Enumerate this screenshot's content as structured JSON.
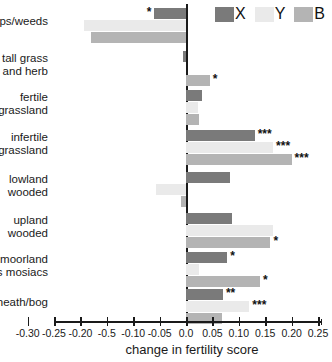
{
  "chart_data": {
    "type": "bar",
    "orientation": "horizontal",
    "title": "",
    "xlabel": "change in fertility score",
    "ylabel": "",
    "xlim": [
      -0.3,
      0.25
    ],
    "grid": false,
    "legend_position": "top-right",
    "zero_reference_line": true,
    "categories": [
      "crops/weeds",
      "tall grass and herb",
      "fertile grassland",
      "infertile grassland",
      "lowland wooded",
      "upland wooded",
      "moorland grass mosiacs",
      "heath/bog"
    ],
    "category_lines": [
      [
        "crops/weeds"
      ],
      [
        "tall grass",
        "and herb"
      ],
      [
        "fertile",
        "grassland"
      ],
      [
        "infertile",
        "grassland"
      ],
      [
        "lowland",
        "wooded"
      ],
      [
        "upland",
        "wooded"
      ],
      [
        "moorland",
        "grass mosiacs"
      ],
      [
        "heath/bog"
      ]
    ],
    "series": [
      {
        "name": "X",
        "color": "#7a7a7a",
        "values": [
          -0.06,
          -0.005,
          0.03,
          0.13,
          0.083,
          0.088,
          0.078,
          0.07
        ],
        "significance": [
          "*",
          "",
          "",
          "***",
          "",
          "",
          "*",
          "**"
        ]
      },
      {
        "name": "Y",
        "color": "#eaeaea",
        "values": [
          -0.193,
          0.0,
          0.022,
          0.165,
          -0.057,
          0.165,
          0.025,
          0.12
        ],
        "significance": [
          "",
          "",
          "",
          "***",
          "",
          "",
          "",
          "***"
        ]
      },
      {
        "name": "B",
        "color": "#b4b4b4",
        "values": [
          -0.18,
          0.045,
          0.025,
          0.2,
          -0.01,
          0.16,
          0.14,
          0.068
        ],
        "significance": [
          "",
          "*",
          "",
          "***",
          "",
          "*",
          "*",
          ""
        ]
      }
    ],
    "xticks": [
      -0.3,
      -0.25,
      -0.2,
      -0.15,
      -0.1,
      -0.05,
      0.0,
      0.05,
      0.1,
      0.15,
      0.2,
      0.25
    ],
    "xtick_labels": [
      "-0.30",
      "-0.25",
      "-0.20",
      "-0.5",
      "-0.10",
      "-0.05",
      "0.0",
      "0.05",
      "0.10",
      "0.15",
      "0.20",
      "0.25"
    ]
  },
  "legend": {
    "items": [
      {
        "label": "X",
        "color": "#7a7a7a"
      },
      {
        "label": "Y",
        "color": "#eaeaea"
      },
      {
        "label": "B",
        "color": "#b4b4b4"
      }
    ]
  },
  "axis": {
    "x_title": "change in fertility score"
  }
}
